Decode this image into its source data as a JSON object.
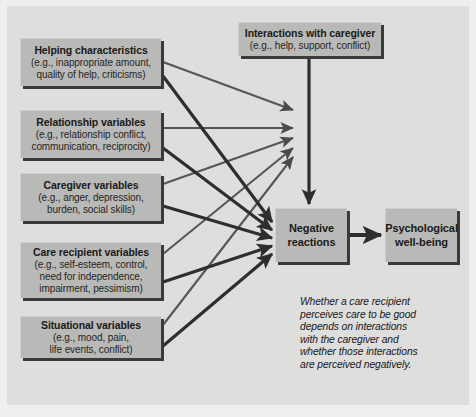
{
  "figure": {
    "background_color": "#efefee",
    "panel_color": "#dededd",
    "box_color": "#b9b9b7",
    "arrow_color": "#39393a",
    "text_color": "#1a1a18"
  },
  "nodes": {
    "helping": {
      "title": "Helping characteristics",
      "detail_line1": "(e.g., inappropriate amount,",
      "detail_line2": "quality of help, criticisms)"
    },
    "relationship": {
      "title": "Relationship variables",
      "detail_line1": "(e.g., relationship conflict,",
      "detail_line2": "communication, reciprocity)"
    },
    "caregiver": {
      "title": "Caregiver variables",
      "detail_line1": "(e.g., anger, depression,",
      "detail_line2": "burden, social skills)"
    },
    "recipient": {
      "title": "Care recipient variables",
      "detail_line1": "(e.g., self-esteem, control,",
      "detail_line2": "need for independence,",
      "detail_line3": "impairment, pessimism)"
    },
    "situational": {
      "title": "Situational variables",
      "detail_line1": "(e.g., mood, pain,",
      "detail_line2": "life events, conflict)"
    },
    "interactions": {
      "title": "Interactions with caregiver",
      "detail_line1": "(e.g., help, support, conflict)"
    },
    "negative": {
      "title_line1": "Negative",
      "title_line2": "reactions"
    },
    "wellbeing": {
      "title_line1": "Psychological",
      "title_line2": "well-being"
    }
  },
  "caption": {
    "line1": "Whether a care recipient",
    "line2": "perceives care to be good",
    "line3": "depends on interactions",
    "line4": "with the caregiver and",
    "line5": "whether those interactions",
    "line6": "are perceived negatively."
  },
  "edges": [
    {
      "from": "helping",
      "to": "interactions-fan"
    },
    {
      "from": "relationship",
      "to": "interactions-fan"
    },
    {
      "from": "caregiver",
      "to": "interactions-fan"
    },
    {
      "from": "recipient",
      "to": "interactions-fan"
    },
    {
      "from": "situational",
      "to": "interactions-fan"
    },
    {
      "from": "helping",
      "to": "negative"
    },
    {
      "from": "relationship",
      "to": "negative"
    },
    {
      "from": "caregiver",
      "to": "negative"
    },
    {
      "from": "recipient",
      "to": "negative"
    },
    {
      "from": "situational",
      "to": "negative"
    },
    {
      "from": "interactions",
      "to": "negative"
    },
    {
      "from": "negative",
      "to": "wellbeing"
    }
  ]
}
